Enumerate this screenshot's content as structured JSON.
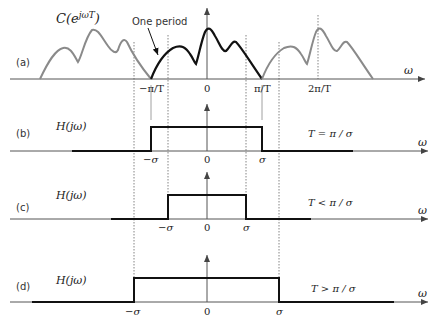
{
  "figure": {
    "panels": {
      "a": {
        "label": "(a)",
        "function_label": "C(e",
        "function_sup": "jωT",
        "function_close": ")",
        "annotation": "One period",
        "axis_var": "ω",
        "ticks": [
          "−π/T",
          "0",
          "π/T",
          "2π/T"
        ]
      },
      "b": {
        "label": "(b)",
        "function_label": "H(jω)",
        "ticks": [
          "−σ",
          "0",
          "σ"
        ],
        "condition": "T = π / σ",
        "axis_var": "ω"
      },
      "c": {
        "label": "(c)",
        "function_label": "H(jω)",
        "ticks": [
          "−σ",
          "0",
          "σ"
        ],
        "condition": "T < π / σ",
        "axis_var": "ω"
      },
      "d": {
        "label": "(d)",
        "function_label": "H(jω)",
        "ticks": [
          "−σ",
          "0",
          "σ"
        ],
        "condition": "T > π / σ",
        "axis_var": "ω"
      }
    },
    "colors": {
      "periodic_copy": "#8a8a8a",
      "one_period": "#111111",
      "axis": "#555555"
    }
  }
}
